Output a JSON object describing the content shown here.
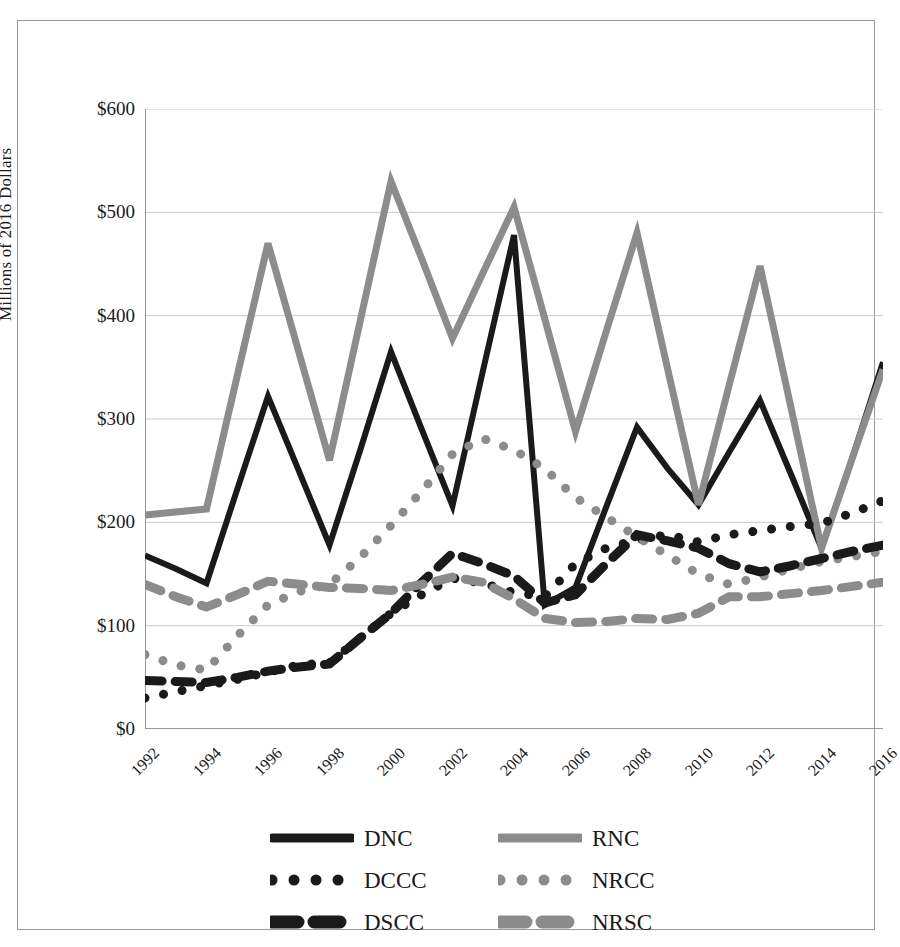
{
  "figure": {
    "frame_visible": true,
    "background_color": "#ffffff"
  },
  "chart_data": {
    "type": "line",
    "title": "",
    "subtitle": "",
    "xlabel": "",
    "ylabel": "Millions of 2016 Dollars",
    "x": [
      1992,
      1993,
      1994,
      1995,
      1996,
      1997,
      1998,
      1999,
      2000,
      2001,
      2002,
      2003,
      2004,
      2005,
      2006,
      2007,
      2008,
      2009,
      2010,
      2011,
      2012,
      2013,
      2014,
      2015,
      2016
    ],
    "xlim": [
      1992,
      2016
    ],
    "ylim": [
      0,
      600
    ],
    "ytick_labels": [
      "$0",
      "$100",
      "$200",
      "$300",
      "$400",
      "$500",
      "$600"
    ],
    "ytick_values": [
      0,
      100,
      200,
      300,
      400,
      500,
      600
    ],
    "xtick_labels": [
      "1992",
      "1994",
      "1996",
      "1998",
      "2000",
      "2002",
      "2004",
      "2006",
      "2008",
      "2010",
      "2012",
      "2014",
      "2016"
    ],
    "xtick_values": [
      1992,
      1994,
      1996,
      1998,
      2000,
      2002,
      2004,
      2006,
      2008,
      2010,
      2012,
      2014,
      2016
    ],
    "grid": "horizontal",
    "legend_position": "bottom",
    "series": [
      {
        "name": "DNC",
        "color": "#1a1a1a",
        "style": "solid",
        "width": 6,
        "values": [
          168,
          155,
          141,
          232,
          322,
          250,
          178,
          270,
          365,
          290,
          216,
          348,
          478,
          120,
          137,
          215,
          292,
          252,
          217,
          268,
          318,
          247,
          175,
          262,
          355
        ]
      },
      {
        "name": "RNC",
        "color": "#8c8c8c",
        "style": "solid",
        "width": 7,
        "values": [
          207,
          210,
          213,
          342,
          470,
          365,
          260,
          395,
          530,
          455,
          378,
          442,
          505,
          397,
          288,
          385,
          480,
          348,
          217,
          333,
          448,
          312,
          175,
          262,
          348
        ]
      },
      {
        "name": "DCCC",
        "color": "#1a1a1a",
        "style": "dotted",
        "width": 9,
        "values": [
          30,
          36,
          42,
          48,
          55,
          62,
          64,
          88,
          112,
          130,
          146,
          141,
          132,
          128,
          160,
          175,
          183,
          188,
          181,
          188,
          192,
          196,
          199,
          209,
          221
        ]
      },
      {
        "name": "NRCC",
        "color": "#8c8c8c",
        "style": "dotted",
        "width": 9,
        "values": [
          72,
          62,
          57,
          90,
          120,
          133,
          140,
          166,
          197,
          230,
          266,
          281,
          270,
          252,
          224,
          205,
          186,
          168,
          150,
          140,
          147,
          155,
          162,
          167,
          172
        ]
      },
      {
        "name": "DSCC",
        "color": "#1a1a1a",
        "style": "dashed",
        "width": 9,
        "values": [
          47,
          46,
          45,
          50,
          56,
          60,
          63,
          88,
          112,
          142,
          170,
          160,
          148,
          122,
          130,
          160,
          188,
          182,
          175,
          160,
          152,
          158,
          165,
          172,
          178
        ]
      },
      {
        "name": "NRSC",
        "color": "#8c8c8c",
        "style": "dashed",
        "width": 9,
        "values": [
          140,
          128,
          118,
          130,
          143,
          140,
          137,
          136,
          134,
          140,
          147,
          142,
          126,
          107,
          103,
          104,
          107,
          106,
          112,
          128,
          128,
          131,
          134,
          138,
          142
        ]
      }
    ]
  },
  "legend": {
    "items": [
      {
        "label": "DNC",
        "color": "#1a1a1a",
        "style": "solid"
      },
      {
        "label": "RNC",
        "color": "#8c8c8c",
        "style": "solid"
      },
      {
        "label": "DCCC",
        "color": "#1a1a1a",
        "style": "dotted"
      },
      {
        "label": "NRCC",
        "color": "#8c8c8c",
        "style": "dotted"
      },
      {
        "label": "DSCC",
        "color": "#1a1a1a",
        "style": "dashed"
      },
      {
        "label": "NRSC",
        "color": "#8c8c8c",
        "style": "dashed"
      }
    ]
  }
}
